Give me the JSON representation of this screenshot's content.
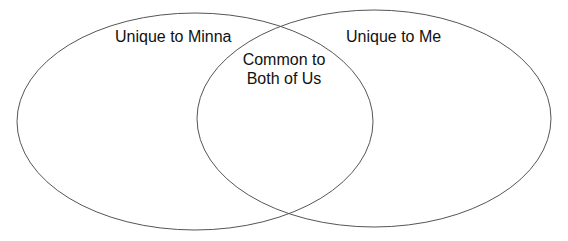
{
  "diagram": {
    "type": "venn",
    "sets": [
      {
        "name": "left",
        "label": "Unique to Minna"
      },
      {
        "name": "right",
        "label": "Unique to Me"
      }
    ],
    "intersection": {
      "line1": "Common to",
      "line2": "Both of Us"
    },
    "colors": {
      "stroke": "#555555",
      "text": "#111111",
      "background": "#ffffff"
    }
  }
}
